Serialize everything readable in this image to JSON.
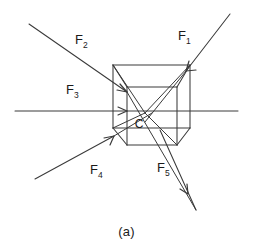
{
  "figure": {
    "caption": "(a)",
    "center_label": "C",
    "stroke_color": "#3a3a3a",
    "background_color": "#ffffff",
    "forces": [
      {
        "id": "F1",
        "name": "F",
        "subscript": "1",
        "label_x": 178,
        "label_y": 40,
        "direction": "incoming from upper-right",
        "line": {
          "x1": 230,
          "y1": 14,
          "x2": 186,
          "y2": 71
        },
        "arrow_at": {
          "x": 186,
          "y": 71
        }
      },
      {
        "id": "F2",
        "name": "F",
        "subscript": "2",
        "label_x": 75,
        "label_y": 44,
        "direction": "incoming from upper-left",
        "line": {
          "x1": 29,
          "y1": 24,
          "x2": 127,
          "y2": 92
        },
        "arrow_at": {
          "x": 127,
          "y": 92
        }
      },
      {
        "id": "F3",
        "name": "F",
        "subscript": "3",
        "label_x": 66,
        "label_y": 94,
        "direction": "incoming horizontal from left",
        "line": {
          "x1": 15,
          "y1": 111,
          "x2": 127,
          "y2": 111
        },
        "arrow_at": {
          "x": 127,
          "y": 111
        }
      },
      {
        "id": "F4",
        "name": "F",
        "subscript": "4",
        "label_x": 90,
        "label_y": 174,
        "direction": "incoming from lower-left",
        "line": {
          "x1": 35,
          "y1": 179,
          "x2": 114,
          "y2": 136
        },
        "arrow_at": {
          "x": 114,
          "y": 136
        }
      },
      {
        "id": "F5",
        "name": "F",
        "subscript": "5",
        "label_x": 157,
        "label_y": 172,
        "direction": "outgoing toward lower-right",
        "line": {
          "x1": 160,
          "y1": 130,
          "x2": 196,
          "y2": 210
        },
        "arrow_at": {
          "x": 188,
          "y": 194
        }
      }
    ]
  }
}
